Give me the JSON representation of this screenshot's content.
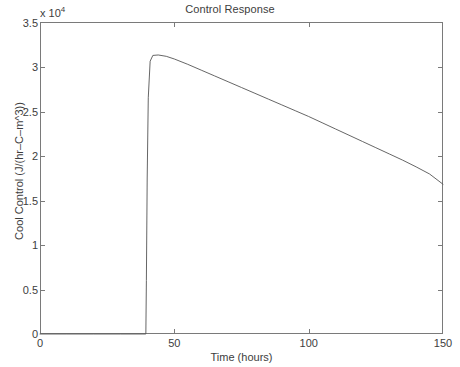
{
  "figure": {
    "title": "Control Response",
    "exponent_label": "x 10",
    "exponent_power": "4",
    "background_color": "#ffffff",
    "axis_color": "#7a7a7a",
    "line_color": "#555555",
    "text_color": "#3d3d3d"
  },
  "axes": {
    "xlabel": "Time (hours)",
    "ylabel": "Cool Control (J/(hr–C–m^3))",
    "x_ticks": [
      "0",
      "50",
      "100",
      "150"
    ],
    "y_ticks": [
      "0",
      "0.5",
      "1",
      "1.5",
      "2",
      "2.5",
      "3",
      "3.5"
    ]
  },
  "chart_data": {
    "type": "line",
    "title": "Control Response",
    "xlabel": "Time (hours)",
    "ylabel": "Cool Control (J/(hr–C–m^3))",
    "y_scale_factor": 10000,
    "y_scale_label": "x 10^4",
    "xlim": [
      0,
      150
    ],
    "ylim": [
      0,
      35000
    ],
    "x_ticks": [
      0,
      50,
      100,
      150
    ],
    "y_ticks": [
      0,
      5000,
      10000,
      15000,
      20000,
      25000,
      30000,
      35000
    ],
    "grid": false,
    "legend": null,
    "series": [
      {
        "name": "Cool Control",
        "x": [
          0,
          10,
          20,
          30,
          38,
          39.4,
          39.6,
          39.9,
          40.3,
          41.0,
          42.0,
          44.0,
          47.0,
          50.0,
          55.0,
          60.0,
          65.0,
          70.0,
          75.0,
          80.0,
          85.0,
          90.0,
          95.0,
          100.0,
          105.0,
          110.0,
          115.0,
          120.0,
          125.0,
          130.0,
          135.0,
          140.0,
          145.0,
          150.0
        ],
        "y": [
          0,
          0,
          0,
          0,
          0,
          0,
          6000,
          17500,
          26500,
          30600,
          31250,
          31300,
          31150,
          30850,
          30250,
          29600,
          28950,
          28300,
          27650,
          27000,
          26350,
          25700,
          25050,
          24400,
          23700,
          23000,
          22300,
          21600,
          20900,
          20200,
          19500,
          18750,
          17950,
          16800
        ]
      }
    ]
  }
}
